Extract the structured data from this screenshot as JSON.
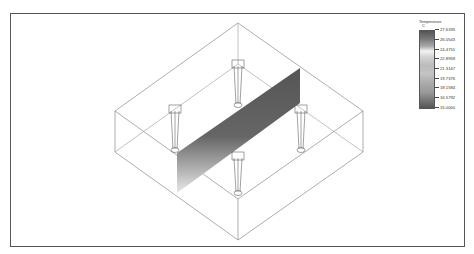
{
  "legend": {
    "title": "Temperature",
    "unit": "C",
    "ticks": [
      "27.6335",
      "26.0543",
      "24.4751",
      "22.8959",
      "21.3167",
      "19.7376",
      "18.1584",
      "16.5792",
      "15.0000"
    ]
  },
  "colors": {
    "frame": "#555555",
    "box_lines": "#666666",
    "plane_dark": "#5a5a5a",
    "plane_light": "#dddddd"
  }
}
